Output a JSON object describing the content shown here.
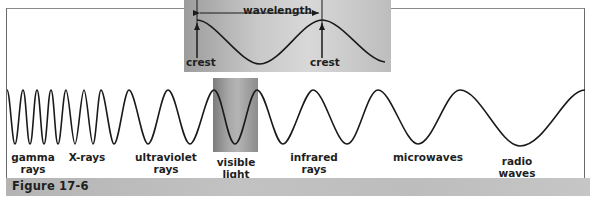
{
  "figure": {
    "caption": "Figure 17-6",
    "inset": {
      "wavelength_label": "wavelength",
      "crest_left_label": "crest",
      "crest_right_label": "crest"
    },
    "spectrum_labels": [
      {
        "id": "gamma",
        "text": "gamma\nrays"
      },
      {
        "id": "xrays",
        "text": "X-rays"
      },
      {
        "id": "ultraviolet",
        "text": "ultraviolet\nrays"
      },
      {
        "id": "visible",
        "text": "visible\nlight"
      },
      {
        "id": "infrared",
        "text": "infrared\nrays"
      },
      {
        "id": "microwaves",
        "text": "microwaves"
      },
      {
        "id": "radio",
        "text": "radio\nwaves"
      }
    ],
    "colors": {
      "line": "#1a1a1a",
      "caption_bar": "#bdbdbd",
      "inset_bg": "#c8c8c8",
      "visible_band": "#a0a0a0"
    }
  }
}
